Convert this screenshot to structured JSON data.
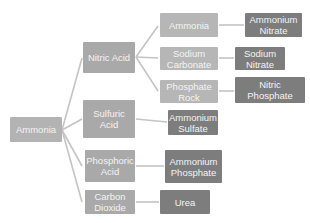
{
  "diagram": {
    "type": "tree",
    "root": {
      "label": "Ammonia"
    },
    "branches": [
      {
        "label": "Nitric Acid",
        "children": [
          {
            "label": "Ammonia",
            "product": "Ammonium Nitrate"
          },
          {
            "label": "Sodium Carbonate",
            "product": "Sodium Nitrate"
          },
          {
            "label": "Phosphate Rock",
            "product": "Nitric Phosphate"
          }
        ]
      },
      {
        "label": "Sulfuric Acid",
        "product": "Ammonium Sulfate"
      },
      {
        "label": "Phosphoric Acid",
        "product": "Ammonium Phosphate"
      },
      {
        "label": "Carbon Dioxide",
        "product": "Urea"
      }
    ]
  },
  "colors": {
    "root": "#b3b3b3",
    "intermediate": "#a9a9a9",
    "reactant": "#b6b6b6",
    "product": "#7d7d7d",
    "connector": "#c4c4c4",
    "text": "#f4f4f4"
  }
}
